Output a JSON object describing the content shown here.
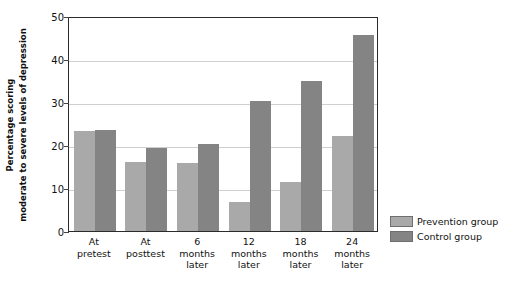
{
  "chart_data": {
    "type": "bar",
    "title": "",
    "subtitle": "",
    "xlabel": "",
    "ylabel": "Percentage scoring moderate to severe levels of depression",
    "ylabel_lines": [
      "Percentage scoring",
      "moderate to severe levels of depression"
    ],
    "categories": [
      "At pretest",
      "At posttest",
      "6 months later",
      "12 months later",
      "18 months later",
      "24 months later"
    ],
    "category_lines": [
      [
        "At",
        "pretest"
      ],
      [
        "At",
        "posttest"
      ],
      [
        "6",
        "months",
        "later"
      ],
      [
        "12",
        "months",
        "later"
      ],
      [
        "18",
        "months",
        "later"
      ],
      [
        "24",
        "months",
        "later"
      ]
    ],
    "series": [
      {
        "name": "Prevention group",
        "color": "#a9a9a9",
        "values": [
          23.2,
          16.0,
          15.8,
          6.7,
          11.4,
          22.1
        ]
      },
      {
        "name": "Control group",
        "color": "#848484",
        "values": [
          23.4,
          19.3,
          20.2,
          30.3,
          35.0,
          45.7
        ]
      }
    ],
    "ylim": [
      0,
      50
    ],
    "ytick_values": [
      0,
      10,
      20,
      30,
      40,
      50
    ],
    "ytick_labels": [
      "0",
      "10",
      "20",
      "30",
      "40",
      "50"
    ],
    "grid": true,
    "grid_color": "#cfcfcf",
    "legend_position": "right",
    "axis_color": "#2b2b2b"
  },
  "legend": {
    "entries": [
      {
        "label": "Prevention group",
        "color": "#a9a9a9"
      },
      {
        "label": "Control group",
        "color": "#848484"
      }
    ]
  }
}
